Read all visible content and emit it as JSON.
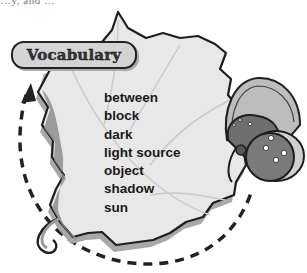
{
  "page": {
    "top_fragment": "…y, and …",
    "vocabulary": {
      "title": "Vocabulary",
      "words": [
        "between",
        "block",
        "dark",
        "light source",
        "object",
        "shadow",
        "sun"
      ]
    },
    "illustration": {
      "leaf": {
        "fill": "#e6e6e6",
        "shadow": "#9a9a9a",
        "outline": "#1e1e1e"
      },
      "butterfly": {
        "wing_fill": "#7a7a7a",
        "spot_color": "#ffffff"
      },
      "cycle_arrow": {
        "style": "dashed",
        "color": "#222222",
        "direction": "counterclockwise-up"
      }
    }
  }
}
